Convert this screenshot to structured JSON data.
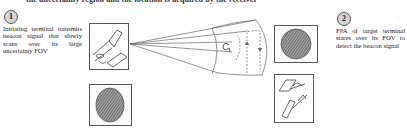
{
  "figure": {
    "top_caption": "the uncertainty region and the location is acquired by the receiver",
    "step1": {
      "badge": "1",
      "description": "Initiating terminal transmits beacon signal that slowly scans over its large uncertainty FOV"
    },
    "step2": {
      "badge": "2",
      "description": "FPA of target terminal stares over its FOV to detect the beacon signal"
    },
    "elements": {
      "initiating_terminal_icon": "terminal-icon",
      "initiating_fpa_icon": "fpa-icon",
      "target_fpa_icon": "fpa-icon",
      "target_terminal_icon": "terminal-icon",
      "scan_cone": "beacon-scan-cone"
    },
    "colors": {
      "line": "#555555",
      "badge_fill": "#d4d4d4",
      "fpa_fill": "#6a6a6a"
    }
  }
}
